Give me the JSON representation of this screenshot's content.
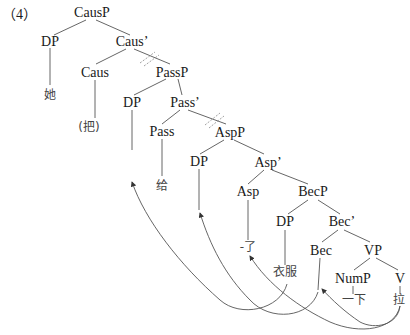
{
  "example_label": "（4）",
  "tree": {
    "nodes": {
      "CausP": "CausP",
      "DP_subj": "DP",
      "Caus_bar": "Caus’",
      "Caus": "Caus",
      "PassP": "PassP",
      "DP_pass": "DP",
      "Pass_bar": "Pass’",
      "Pass": "Pass",
      "AspP": "AspP",
      "DP_asp": "DP",
      "Asp_bar": "Asp’",
      "Asp": "Asp",
      "BecP": "BecP",
      "DP_bec": "DP",
      "Bec_bar": "Bec’",
      "Bec": "Bec",
      "VP": "VP",
      "NumP": "NumP",
      "V": "V"
    },
    "leaves": {
      "subj": "她",
      "ba": "(把)",
      "gei": "给",
      "le": "-了",
      "yifu": "衣服",
      "yixia": "一下",
      "la": "拉"
    },
    "strikethrough_branches": [
      "Caus’→PassP",
      "Pass’→AspP"
    ],
    "movement_arrows": [
      {
        "from": "衣服",
        "to": "DP (Spec-PassP)"
      },
      {
        "from": "Bec",
        "to": "DP (Spec-AspP)"
      },
      {
        "from": "拉",
        "to": "-了"
      },
      {
        "from": "拉",
        "to": "Bec"
      }
    ]
  }
}
